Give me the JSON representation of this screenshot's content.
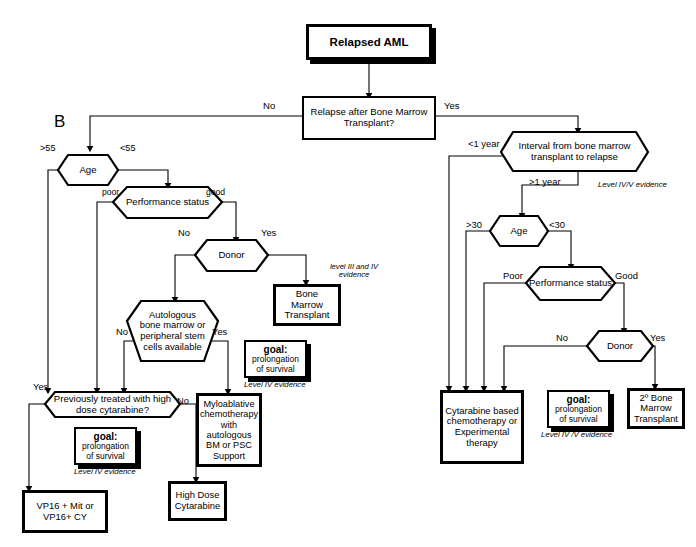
{
  "figure": {
    "panel_letter": "B",
    "title_node": "Relapsed AML"
  },
  "nodes": {
    "root": "Relapsed AML",
    "q_relapse_after_bmt": "Relapse after Bone Marrow Transplant?",
    "left": {
      "age": "Age",
      "performance_status": "Performance status",
      "donor": "Donor",
      "autologous": "Autologous bone marrow or peripheral stem cells available",
      "prev_treated": "Previously treated with high dose cytarabine?",
      "bone_marrow_transplant": "Bone Marrow Transplant",
      "myeloablative": "Myloablative chemotherapy with autologous BM or PSC Support",
      "high_dose_cytarabine": "High Dose Cytarabine",
      "vp16": "VP16 + Mit or VP16+ CY"
    },
    "right": {
      "interval": "Interval from bone marrow transplant to relapse",
      "age": "Age",
      "performance_status": "Performance status",
      "donor": "Donor",
      "cytarabine_based": "Cytarabine based chemotherapy or Experimental therapy",
      "second_bmt": "2º Bone Marrow Transplant"
    }
  },
  "goal_boxes": {
    "left_lower": {
      "title": "goal:",
      "line1": "prolongation",
      "line2": "of survival"
    },
    "left_mid": {
      "title": "goal:",
      "line1": "prolongation",
      "line2": "of survival"
    },
    "right": {
      "title": "goal:",
      "line1": "prolongation",
      "line2": "of survival"
    }
  },
  "edge_labels": {
    "relapse_no": "No",
    "relapse_yes": "Yes",
    "age_gt55": ">55",
    "age_lt55": "<55",
    "ps_poor": "poor",
    "ps_good": "good",
    "donor_no": "No",
    "donor_yes": "Yes",
    "auto_no": "No",
    "auto_yes": "Yes",
    "prev_yes": "Yes",
    "prev_no": "No",
    "interval_lt1": "<1 year",
    "interval_gt1": ">1 year",
    "rage_gt30": ">30",
    "rage_lt30": "<30",
    "rps_poor": "Poor",
    "rps_good": "Good",
    "rdonor_no": "No",
    "rdonor_yes": "Yes"
  },
  "evidence_labels": {
    "level_3_4": "level III and IV evidence",
    "level_4_left_mid": "Level IV evidence",
    "level_4_left_lower": "Level IV evidence",
    "level_4_5_right_top": "Level IV/V evidence",
    "level_4_5_right_bottom": "Level IV /V evidence"
  },
  "style": {
    "stroke": "#000000",
    "fill": "#ffffff",
    "shadow": "#000000"
  }
}
